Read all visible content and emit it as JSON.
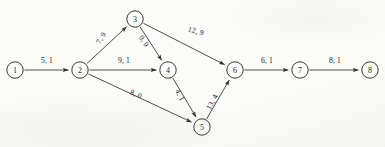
{
  "diagram": {
    "type": "directed-network-graph",
    "title": "",
    "label_format": "cost, flow",
    "background_color": "#fbfbf9",
    "line_color": "#3a3a38",
    "text_color": "#23231f",
    "nodes": [
      {
        "id": "1",
        "label": "1",
        "x": 15,
        "y": 70,
        "r": 8.2
      },
      {
        "id": "2",
        "label": "2",
        "x": 80,
        "y": 70,
        "r": 8.2
      },
      {
        "id": "3",
        "label": "3",
        "x": 135,
        "y": 19,
        "r": 8.2
      },
      {
        "id": "4",
        "label": "4",
        "x": 168,
        "y": 70,
        "r": 8.2
      },
      {
        "id": "5",
        "label": "5",
        "x": 202,
        "y": 127,
        "r": 8.2
      },
      {
        "id": "6",
        "label": "6",
        "x": 235,
        "y": 70,
        "r": 8.2
      },
      {
        "id": "7",
        "label": "7",
        "x": 300,
        "y": 70,
        "r": 8.2
      },
      {
        "id": "8",
        "label": "8",
        "x": 370,
        "y": 70,
        "r": 8.2
      }
    ],
    "edges": [
      {
        "id": "e1-2",
        "from": "1",
        "to": "2",
        "label": "5, 1",
        "cost": 5,
        "flow": 1,
        "lx": 47,
        "ly": 60,
        "rot": 0
      },
      {
        "id": "e2-3",
        "from": "2",
        "to": "3",
        "label": "7, 9",
        "cost": 7,
        "flow": 9,
        "lx": 101,
        "ly": 38,
        "rot": -58
      },
      {
        "id": "e2-4",
        "from": "2",
        "to": "4",
        "label": "9, 1",
        "cost": 9,
        "flow": 1,
        "lx": 124,
        "ly": 60,
        "rot": 0
      },
      {
        "id": "e2-5",
        "from": "2",
        "to": "5",
        "label": "8, 0",
        "cost": 8,
        "flow": 0,
        "lx": 136,
        "ly": 94,
        "rot": 22
      },
      {
        "id": "e3-4",
        "from": "3",
        "to": "4",
        "label": "0, 0",
        "cost": 0,
        "flow": 0,
        "lx": 144,
        "ly": 41,
        "rot": 58
      },
      {
        "id": "e3-6",
        "from": "3",
        "to": "6",
        "label": "12, 9",
        "cost": 12,
        "flow": 9,
        "lx": 196,
        "ly": 31,
        "rot": 16
      },
      {
        "id": "e4-5",
        "from": "4",
        "to": "5",
        "label": "4, 1",
        "cost": 4,
        "flow": 1,
        "lx": 180,
        "ly": 95,
        "rot": 62
      },
      {
        "id": "e5-6",
        "from": "5",
        "to": "6",
        "label": "13, 4",
        "cost": 13,
        "flow": 4,
        "lx": 212,
        "ly": 102,
        "rot": -62
      },
      {
        "id": "e6-7",
        "from": "6",
        "to": "7",
        "label": "6, 1",
        "cost": 6,
        "flow": 1,
        "lx": 267,
        "ly": 60,
        "rot": 0
      },
      {
        "id": "e7-8",
        "from": "7",
        "to": "8",
        "label": "8, 1",
        "cost": 8,
        "flow": 1,
        "lx": 335,
        "ly": 60,
        "rot": 0
      }
    ]
  }
}
